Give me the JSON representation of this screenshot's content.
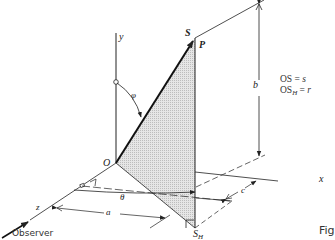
{
  "figure": {
    "axes": {
      "y": "y",
      "x": "x",
      "z": "z",
      "origin": "O"
    },
    "points": {
      "S": "S",
      "P": "P",
      "S_H_main": "S",
      "S_H_sub": "H"
    },
    "angles": {
      "phi": "φ",
      "theta": "θ"
    },
    "dimensions": {
      "a": "a",
      "b": "b",
      "c": "c"
    },
    "equations": [
      {
        "lhs": "OS",
        "sub": "",
        "rhs": "s"
      },
      {
        "lhs": "OS",
        "sub": "H",
        "rhs": "r"
      }
    ],
    "observer_label": "Observer",
    "caption_fragment": "Fig"
  },
  "colors": {
    "line": "#222222",
    "shade": "#d9d9d9",
    "background": "#ffffff"
  }
}
